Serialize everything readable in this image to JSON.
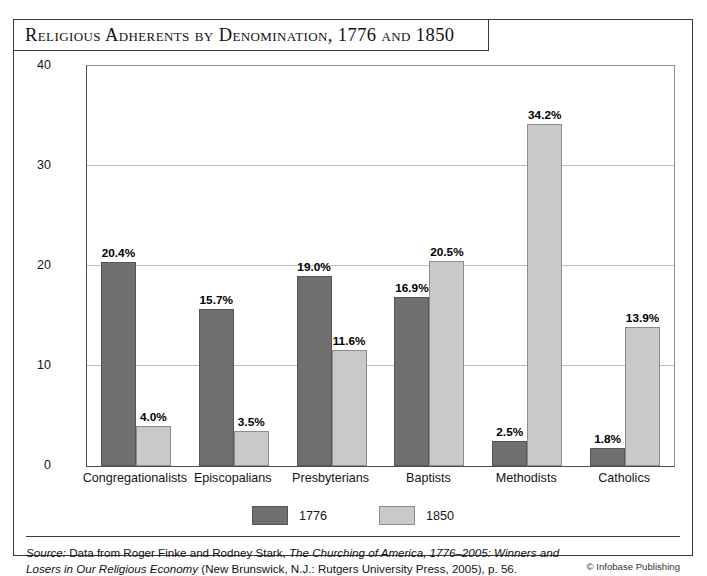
{
  "figure": {
    "title": "Religious Adherents by Denomination, 1776 and 1850",
    "copyright": "© Infobase Publishing",
    "source_label": "Source:",
    "source_text_1": " Data from Roger Finke and Rodney Stark, ",
    "source_work": "The Churching of America, 1776–2005: Winners and Losers in Our Religious Economy",
    "source_text_2": " (New Brunswick, N.J.: Rutgers University Press, 2005), p. 56."
  },
  "chart_data": {
    "type": "bar",
    "title": "Religious Adherents by Denomination, 1776 and 1850",
    "xlabel": "",
    "ylabel": "Percentage of Religious Adherents (as percentage of total adherents)",
    "ylabel_line1": "Percentage of Religious Adherents",
    "ylabel_line2": "(as percentage of total adherents)",
    "ylim": [
      0,
      40
    ],
    "yticks": [
      0,
      10,
      20,
      30,
      40
    ],
    "ytick_labels": [
      "0",
      "10",
      "20",
      "30",
      "40"
    ],
    "grid": true,
    "legend_position": "bottom-center",
    "categories": [
      "Congregationalists",
      "Episcopalians",
      "Presbyterians",
      "Baptists",
      "Methodists",
      "Catholics"
    ],
    "series": [
      {
        "name": "1776",
        "color": "#6f6f6f",
        "values": [
          20.4,
          15.7,
          19.0,
          16.9,
          2.5,
          1.8
        ],
        "data_labels": [
          "20.4%",
          "15.7%",
          "19.0%",
          "16.9%",
          "2.5%",
          "1.8%"
        ]
      },
      {
        "name": "1850",
        "color": "#c9c9c9",
        "values": [
          4.0,
          3.5,
          11.6,
          20.5,
          34.2,
          13.9
        ],
        "data_labels": [
          "4.0%",
          "3.5%",
          "11.6%",
          "20.5%",
          "34.2%",
          "13.9%"
        ]
      }
    ]
  }
}
